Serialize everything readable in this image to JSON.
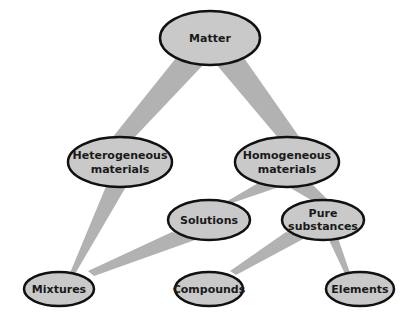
{
  "colors": {
    "node_fill": "#c9c9c9",
    "node_stroke": "#111111",
    "edge_fill": "#b2b2b2",
    "background": "#ffffff"
  },
  "nodes": {
    "matter": {
      "line1": "Matter",
      "line2": ""
    },
    "heterogeneous": {
      "line1": "Heterogeneous",
      "line2": "materials"
    },
    "homogeneous": {
      "line1": "Homogeneous",
      "line2": "materials"
    },
    "solutions": {
      "line1": "Solutions",
      "line2": ""
    },
    "pure": {
      "line1": "Pure",
      "line2": "substances"
    },
    "mixtures": {
      "line1": "Mixtures",
      "line2": ""
    },
    "compounds": {
      "line1": "Compounds",
      "line2": ""
    },
    "elements": {
      "line1": "Elements",
      "line2": ""
    }
  },
  "edges": [
    {
      "from": "Matter",
      "to": "Heterogeneous materials"
    },
    {
      "from": "Matter",
      "to": "Homogeneous materials"
    },
    {
      "from": "Heterogeneous materials",
      "to": "Mixtures"
    },
    {
      "from": "Homogeneous materials",
      "to": "Solutions"
    },
    {
      "from": "Homogeneous materials",
      "to": "Pure substances"
    },
    {
      "from": "Solutions",
      "to": "Mixtures"
    },
    {
      "from": "Pure substances",
      "to": "Compounds"
    },
    {
      "from": "Pure substances",
      "to": "Elements"
    }
  ]
}
